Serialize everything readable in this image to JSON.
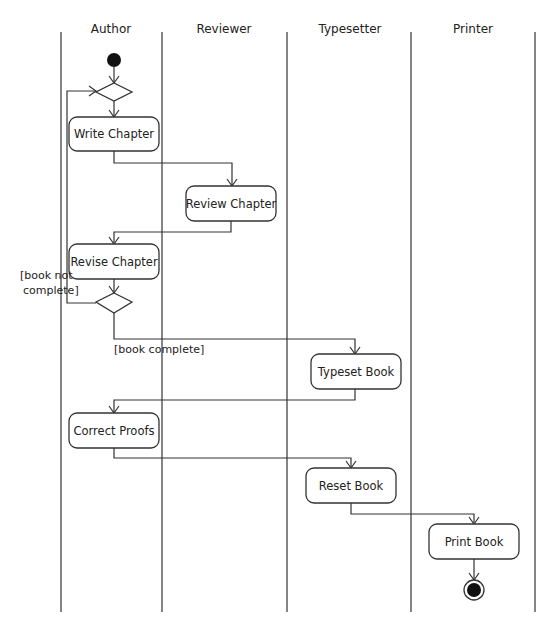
{
  "diagram": {
    "type": "UML activity diagram (swimlanes)",
    "lanes": [
      {
        "label": "Author"
      },
      {
        "label": "Reviewer"
      },
      {
        "label": "Typesetter"
      },
      {
        "label": "Printer"
      }
    ],
    "activities": {
      "write_chapter": "Write Chapter",
      "review_chapter": "Review Chapter",
      "revise_chapter": "Revise Chapter",
      "typeset_book": "Typeset Book",
      "correct_proofs": "Correct Proofs",
      "reset_book": "Reset Book",
      "print_book": "Print Book"
    },
    "guards": {
      "not_complete_line1": "[book not",
      "not_complete_line2": "complete]",
      "complete": "[book complete]"
    },
    "flows": [
      {
        "from": "start",
        "to": "merge"
      },
      {
        "from": "merge",
        "to": "Write Chapter"
      },
      {
        "from": "Write Chapter",
        "to": "Review Chapter"
      },
      {
        "from": "Review Chapter",
        "to": "Revise Chapter"
      },
      {
        "from": "Revise Chapter",
        "to": "decision"
      },
      {
        "from": "decision",
        "to": "merge",
        "guard": "[book not complete]"
      },
      {
        "from": "decision",
        "to": "Typeset Book",
        "guard": "[book complete]"
      },
      {
        "from": "Typeset Book",
        "to": "Correct Proofs"
      },
      {
        "from": "Correct Proofs",
        "to": "Reset Book"
      },
      {
        "from": "Reset Book",
        "to": "Print Book"
      },
      {
        "from": "Print Book",
        "to": "end"
      }
    ]
  }
}
